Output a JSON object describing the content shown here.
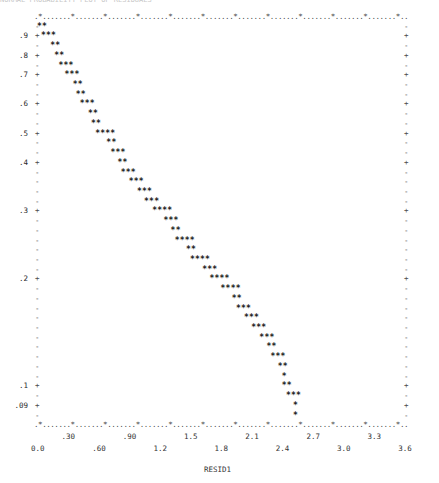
{
  "chart_data": {
    "type": "scatter",
    "style": "line-printer character plot",
    "title": "NORMAL PROBABILITY PLOT OF RESIDUALS",
    "xlabel": "RESID1",
    "ylabel": "",
    "xlim": [
      0.0,
      3.75
    ],
    "x_tick_labels_upper": [
      ".30",
      ".90",
      "1.5",
      "2.1",
      "2.7",
      "3.3"
    ],
    "x_tick_values_upper": [
      0.3,
      0.9,
      1.5,
      2.1,
      2.7,
      3.3
    ],
    "x_tick_labels_lower": [
      "0.0",
      ".60",
      "1.2",
      "1.8",
      "2.4",
      "3.0",
      "3.6"
    ],
    "x_tick_values_lower": [
      0.0,
      0.6,
      1.2,
      1.8,
      2.4,
      3.0,
      3.6
    ],
    "y_tick_labels": [
      ".9",
      ".8",
      ".7",
      ".6",
      ".5",
      ".4",
      ".3",
      ".2",
      ".1",
      ".09"
    ],
    "grid": false,
    "plot_symbol": "*",
    "rows": [
      {
        "ylabel": "",
        "mark": "-",
        "x": 0.0,
        "n": 2
      },
      {
        "ylabel": ".9",
        "mark": "+",
        "x": 0.04,
        "n": 3
      },
      {
        "ylabel": "",
        "mark": "-",
        "x": 0.13,
        "n": 2
      },
      {
        "ylabel": ".8",
        "mark": "+",
        "x": 0.17,
        "n": 2
      },
      {
        "ylabel": "",
        "mark": "-",
        "x": 0.21,
        "n": 3
      },
      {
        "ylabel": ".7",
        "mark": "+",
        "x": 0.27,
        "n": 3
      },
      {
        "ylabel": "",
        "mark": "-",
        "x": 0.35,
        "n": 2
      },
      {
        "ylabel": "",
        "mark": "-",
        "x": 0.38,
        "n": 2
      },
      {
        "ylabel": ".6",
        "mark": "+",
        "x": 0.42,
        "n": 3
      },
      {
        "ylabel": "",
        "mark": "-",
        "x": 0.5,
        "n": 2
      },
      {
        "ylabel": "",
        "mark": "-",
        "x": 0.53,
        "n": 2
      },
      {
        "ylabel": ".5",
        "mark": "+",
        "x": 0.57,
        "n": 4
      },
      {
        "ylabel": "",
        "mark": "-",
        "x": 0.68,
        "n": 2
      },
      {
        "ylabel": "",
        "mark": "-",
        "x": 0.72,
        "n": 3
      },
      {
        "ylabel": ".4",
        "mark": "+",
        "x": 0.79,
        "n": 2
      },
      {
        "ylabel": "",
        "mark": "-",
        "x": 0.82,
        "n": 3
      },
      {
        "ylabel": "",
        "mark": "-",
        "x": 0.9,
        "n": 3
      },
      {
        "ylabel": "",
        "mark": "-",
        "x": 0.98,
        "n": 3
      },
      {
        "ylabel": "",
        "mark": "-",
        "x": 1.05,
        "n": 3
      },
      {
        "ylabel": ".3",
        "mark": "+",
        "x": 1.13,
        "n": 4
      },
      {
        "ylabel": "",
        "mark": "-",
        "x": 1.24,
        "n": 3
      },
      {
        "ylabel": "",
        "mark": "-",
        "x": 1.31,
        "n": 2
      },
      {
        "ylabel": "",
        "mark": "-",
        "x": 1.35,
        "n": 4
      },
      {
        "ylabel": "",
        "mark": "-",
        "x": 1.46,
        "n": 2
      },
      {
        "ylabel": "",
        "mark": "-",
        "x": 1.5,
        "n": 4
      },
      {
        "ylabel": "",
        "mark": "-",
        "x": 1.62,
        "n": 3
      },
      {
        "ylabel": ".2",
        "mark": "+",
        "x": 1.69,
        "n": 4
      },
      {
        "ylabel": "",
        "mark": "-",
        "x": 1.8,
        "n": 4
      },
      {
        "ylabel": "",
        "mark": "-",
        "x": 1.91,
        "n": 2
      },
      {
        "ylabel": "",
        "mark": "-",
        "x": 1.95,
        "n": 3
      },
      {
        "ylabel": "",
        "mark": "-",
        "x": 2.03,
        "n": 3
      },
      {
        "ylabel": "",
        "mark": "-",
        "x": 2.1,
        "n": 3
      },
      {
        "ylabel": "",
        "mark": "-",
        "x": 2.18,
        "n": 3
      },
      {
        "ylabel": "",
        "mark": "-",
        "x": 2.25,
        "n": 2
      },
      {
        "ylabel": "",
        "mark": "-",
        "x": 2.29,
        "n": 3
      },
      {
        "ylabel": "",
        "mark": "-",
        "x": 2.36,
        "n": 2
      },
      {
        "ylabel": "",
        "mark": "-",
        "x": 2.4,
        "n": 1
      },
      {
        "ylabel": ".1",
        "mark": "+",
        "x": 2.4,
        "n": 2
      },
      {
        "ylabel": "",
        "mark": "-",
        "x": 2.44,
        "n": 3
      },
      {
        "ylabel": ".09",
        "mark": "+",
        "x": 2.51,
        "n": 1
      },
      {
        "ylabel": "",
        "mark": "-",
        "x": 2.51,
        "n": 1
      }
    ]
  }
}
